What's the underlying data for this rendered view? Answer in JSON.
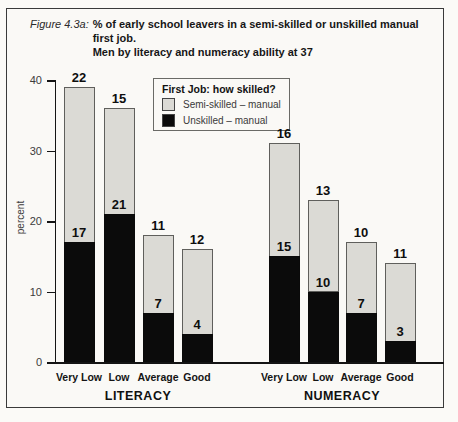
{
  "figure": {
    "title_prefix": "Figure 4.3a:",
    "title_line1": "% of early school leavers in a semi-skilled or unskilled manual first job.",
    "title_line2": "Men by literacy and numeracy ability at 37"
  },
  "legend": {
    "title": "First Job: how skilled?",
    "items": [
      {
        "name": "semi-skilled-manual",
        "label": "Semi-skilled – manual",
        "color": "#dbdad5"
      },
      {
        "name": "unskilled-manual",
        "label": "Unskilled – manual",
        "color": "#0b0b0b"
      }
    ]
  },
  "chart_data": {
    "type": "bar",
    "stacked": true,
    "title": "% of early school leavers in a semi-skilled or unskilled manual first job. Men by literacy and numeracy ability at 37",
    "ylabel": "percent",
    "ylim": [
      0,
      40
    ],
    "yticks": [
      0,
      10,
      20,
      30,
      40
    ],
    "grid": false,
    "legend_position": "upper-center-left",
    "colors": {
      "semi_skilled": "#dbdad5",
      "unskilled": "#0b0b0b"
    },
    "groups": [
      {
        "label": "LITERACY",
        "categories": [
          "Very Low",
          "Low",
          "Average",
          "Good"
        ],
        "series": [
          {
            "name": "Unskilled – manual",
            "values": [
              17,
              21,
              7,
              4
            ]
          },
          {
            "name": "Semi-skilled – manual",
            "values": [
              22,
              15,
              11,
              12
            ]
          }
        ],
        "totals": [
          39,
          36,
          18,
          16
        ]
      },
      {
        "label": "NUMERACY",
        "categories": [
          "Very Low",
          "Low",
          "Average",
          "Good"
        ],
        "series": [
          {
            "name": "Unskilled – manual",
            "values": [
              15,
              10,
              7,
              3
            ]
          },
          {
            "name": "Semi-skilled – manual",
            "values": [
              16,
              13,
              10,
              11
            ]
          }
        ],
        "totals": [
          31,
          23,
          17,
          14
        ]
      }
    ]
  }
}
